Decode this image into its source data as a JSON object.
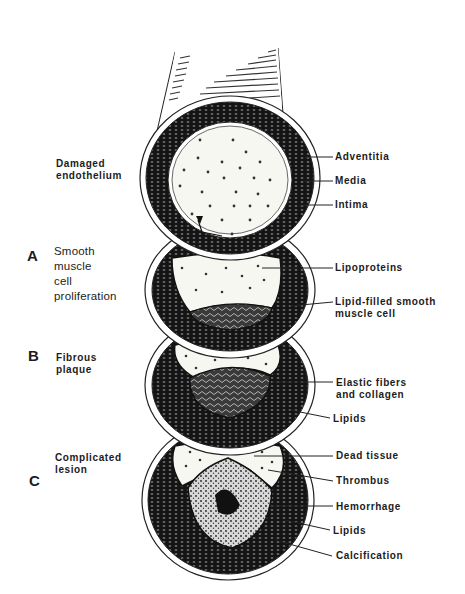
{
  "figure": {
    "colors": {
      "ink": "#1a1a1a",
      "paper": "#ffffff",
      "lumen": "#f7f7f2"
    }
  },
  "left_labels": {
    "top": "Damaged\nendothelium",
    "stage_a": {
      "letter": "A",
      "text": "Smooth\nmuscle\ncell\nproliferation"
    },
    "stage_b": {
      "letter": "B",
      "text": "Fibrous\nplaque"
    },
    "stage_c": {
      "letter": "C",
      "text": "Complicated\nlesion"
    }
  },
  "right_labels": {
    "adventitia": "Adventitia",
    "media": "Media",
    "intima": "Intima",
    "lipoproteins": "Lipoproteins",
    "lipid_smooth_muscle": "Lipid-filled smooth\nmuscle cell",
    "elastic_fibers": "Elastic fibers\nand collagen",
    "lipids_b": "Lipids",
    "dead_tissue": "Dead tissue",
    "thrombus": "Thrombus",
    "hemorrhage": "Hemorrhage",
    "lipids_c": "Lipids",
    "calcification": "Calcification"
  }
}
